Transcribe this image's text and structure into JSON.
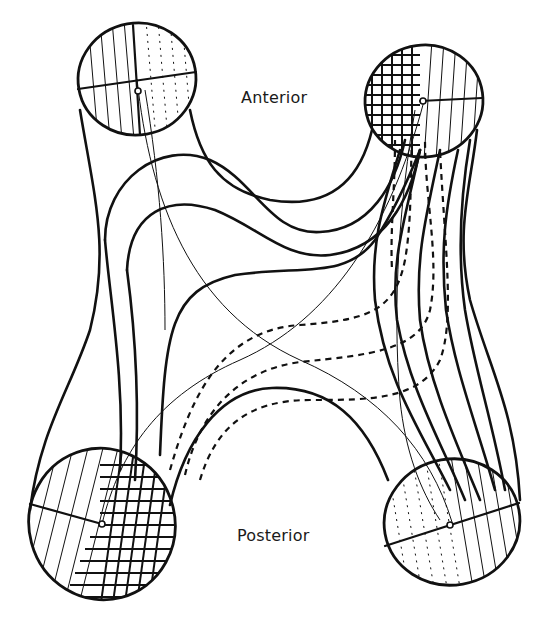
{
  "diagram": {
    "labels": {
      "anterior": "Anterior",
      "posterior": "Posterior"
    },
    "structure": "H-shaped four-limbed outline with circular cross-sections at each end",
    "cross_sections": [
      {
        "id": "top-left",
        "position": "anterior-left",
        "fill": "vertical hatch with dotted lines, quartered by crosshair"
      },
      {
        "id": "top-right",
        "position": "anterior-right",
        "fill": "dense crosshatch grid on left half, vertical hatch on right half"
      },
      {
        "id": "bottom-left",
        "position": "posterior-left",
        "fill": "dense crosshatch grid on right half, diagonal hatch on left half"
      },
      {
        "id": "bottom-right",
        "position": "posterior-right",
        "fill": "vertical hatch with dotted lines, quartered by crosshair"
      }
    ],
    "line_styles": [
      "solid thick",
      "solid thin",
      "dashed"
    ],
    "colors": {
      "ink": "#111111",
      "background": "#ffffff"
    }
  }
}
